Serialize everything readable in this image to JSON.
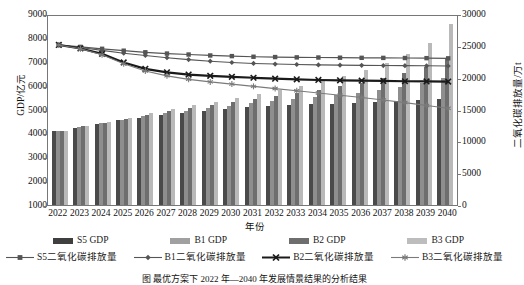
{
  "chart_data": {
    "type": "bar",
    "title": "",
    "xlabel": "年份",
    "ylabel": "GDP/亿元",
    "y2label": "二氧化碳排放量/万t",
    "grid": false,
    "legend_position": "bottom",
    "categories": [
      "2022",
      "2023",
      "2024",
      "2025",
      "2026",
      "2027",
      "2028",
      "2029",
      "2030",
      "2031",
      "2032",
      "2033",
      "2034",
      "2035",
      "2036",
      "2037",
      "2038",
      "2039",
      "2040"
    ],
    "ylim": [
      1000,
      9000
    ],
    "y_ticks": [
      1000,
      2000,
      3000,
      4000,
      5000,
      6000,
      7000,
      8000,
      9000
    ],
    "y2lim": [
      0,
      30000
    ],
    "y2_ticks": [
      0,
      5000,
      10000,
      15000,
      20000,
      25000,
      30000
    ],
    "bar_series": [
      {
        "name": "S5 GDP",
        "color": "#4a4a4a",
        "axis": "left",
        "values": [
          4080,
          4240,
          4380,
          4540,
          4660,
          4780,
          4860,
          4940,
          5020,
          5090,
          5140,
          5180,
          5220,
          5250,
          5280,
          5300,
          5340,
          5380,
          5420
        ]
      },
      {
        "name": "B1 GDP",
        "color": "#8e8e8e",
        "axis": "left",
        "values": [
          4100,
          4270,
          4420,
          4580,
          4720,
          4850,
          4950,
          5050,
          5160,
          5260,
          5350,
          5430,
          5510,
          5600,
          5700,
          5820,
          5960,
          6120,
          6300
        ]
      },
      {
        "name": "B2 GDP",
        "color": "#6e6e6e",
        "axis": "left",
        "values": [
          4110,
          4290,
          4450,
          4620,
          4780,
          4930,
          5060,
          5190,
          5320,
          5450,
          5580,
          5700,
          5830,
          5970,
          6130,
          6320,
          6540,
          6800,
          7100
        ]
      },
      {
        "name": "B3 GDP",
        "color": "#b9b9b9",
        "axis": "left",
        "values": [
          4120,
          4300,
          4480,
          4660,
          4840,
          5010,
          5170,
          5330,
          5490,
          5660,
          5830,
          6000,
          6190,
          6400,
          6650,
          6960,
          7340,
          7800,
          8600
        ]
      }
    ],
    "line_series": [
      {
        "name": "S5二氧化碳排放量",
        "marker": "square",
        "color": "#555555",
        "width": 1.2,
        "axis": "right",
        "values": [
          25450,
          25150,
          24850,
          24550,
          24300,
          24100,
          23950,
          23800,
          23700,
          23600,
          23550,
          23500,
          23480,
          23450,
          23430,
          23420,
          23400,
          23380,
          23350
        ]
      },
      {
        "name": "B1二氧化碳排放量",
        "marker": "diamond",
        "color": "#555555",
        "width": 1.1,
        "axis": "right",
        "values": [
          25450,
          25050,
          24600,
          24150,
          23800,
          23450,
          23150,
          22900,
          22700,
          22550,
          22450,
          22380,
          22320,
          22280,
          22250,
          22220,
          22200,
          22180,
          22150
        ]
      },
      {
        "name": "B2二氧化碳排放量",
        "marker": "cross",
        "color": "#1a1a1a",
        "width": 2.2,
        "axis": "right",
        "values": [
          25450,
          24900,
          24050,
          22700,
          21700,
          21150,
          20800,
          20600,
          20450,
          20300,
          20150,
          20050,
          19950,
          19900,
          19850,
          19800,
          19750,
          19720,
          19700
        ]
      },
      {
        "name": "B3二氧化碳排放量",
        "marker": "asterisk",
        "color": "#7a7a7a",
        "width": 1.1,
        "axis": "right",
        "values": [
          25450,
          24850,
          23900,
          22500,
          21350,
          20600,
          20050,
          19650,
          19300,
          18950,
          18600,
          18250,
          17900,
          17550,
          17200,
          16800,
          16400,
          15950,
          15500
        ]
      }
    ]
  },
  "axes": {
    "y_left_title": "GDP/亿元",
    "y_right_title": "二氧化碳排放量/万t",
    "x_title": "年份"
  },
  "legend": {
    "bars": [
      {
        "label": "S5 GDP",
        "swatch": "sw-s5"
      },
      {
        "label": "B1 GDP",
        "swatch": "sw-b1"
      },
      {
        "label": "B2 GDP",
        "swatch": "sw-b2"
      },
      {
        "label": "B3 GDP",
        "swatch": "sw-b3"
      }
    ],
    "lines": [
      {
        "label": "S5二氧化碳排放量",
        "marker": "square"
      },
      {
        "label": "B1二氧化碳排放量",
        "marker": "diamond"
      },
      {
        "label": "B2二氧化碳排放量",
        "marker": "cross"
      },
      {
        "label": "B3二氧化碳排放量",
        "marker": "asterisk"
      }
    ]
  },
  "caption": "图        最优方案下 2022 年—2040 年发展情景结果的分析结果"
}
